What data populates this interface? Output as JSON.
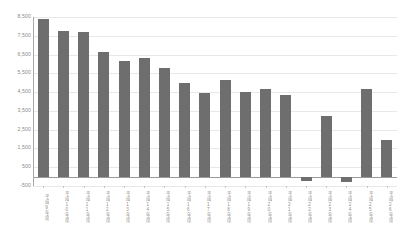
{
  "chart_data": {
    "type": "bar",
    "title": "",
    "subtitle": "",
    "xlabel": "",
    "ylabel": "",
    "legend": [],
    "grid": true,
    "legend_position": "none",
    "ylim": [
      -500,
      8500
    ],
    "y_ticks": [
      8500,
      7500,
      6500,
      5500,
      4500,
      3500,
      2500,
      1500,
      500,
      -500
    ],
    "y_tick_labels": [
      "8,500",
      "7,500",
      "6,500",
      "5,500",
      "4,500",
      "3,500",
      "2,500",
      "1,500",
      "500",
      "-500"
    ],
    "categories": [
      "平成9年度",
      "平成10年度",
      "平成11年度",
      "平成12年度",
      "平成13年度",
      "平成14年度",
      "平成15年度",
      "平成16年度",
      "平成17年度",
      "平成18年度",
      "平成19年度",
      "平成20年度",
      "平成21年度",
      "平成22年度",
      "平成23年度",
      "平成24年度",
      "平成25年度",
      "平成26年度"
    ],
    "values": [
      8400,
      7750,
      7700,
      6650,
      6150,
      6300,
      5800,
      5000,
      4450,
      5150,
      4500,
      4650,
      4350,
      -250,
      3250,
      -300,
      4650,
      1950
    ],
    "series": [
      {
        "name": "",
        "color": "#6e6e6e",
        "values": [
          8400,
          7750,
          7700,
          6650,
          6150,
          6300,
          5800,
          5000,
          4450,
          5150,
          4500,
          4650,
          4350,
          -250,
          3250,
          -300,
          4650,
          1950
        ]
      }
    ],
    "bar_color": "#6e6e6e",
    "gridline_color": "#e8e8e8",
    "axis_color": "#a8a8a8",
    "tick_label_color": "#8a8a8a",
    "background_color": "#ffffff"
  }
}
